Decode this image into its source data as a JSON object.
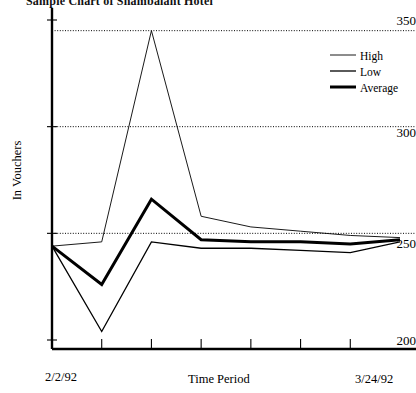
{
  "chart_data": {
    "type": "line",
    "title": "Sample Chart of Shambalaht Hotel",
    "xlabel": "Time Period",
    "ylabel": "In Vouchers",
    "ylim": [
      195,
      356
    ],
    "yticks": [
      200,
      250,
      300,
      350
    ],
    "gridlines": [
      250,
      300,
      345
    ],
    "grid": true,
    "legend_position": "top-right",
    "x_start_label": "2/2/92",
    "x_end_label": "3/24/92",
    "x_tick_count": 6,
    "x": [
      0,
      1,
      2,
      3,
      4,
      5,
      6,
      7
    ],
    "series": [
      {
        "name": "High",
        "color": "#000000",
        "width": 0.9,
        "values": [
          244,
          246,
          345,
          258,
          253,
          251,
          249,
          248
        ]
      },
      {
        "name": "Low",
        "color": "#000000",
        "width": 1.3,
        "values": [
          244,
          204,
          246,
          243,
          243,
          242,
          241,
          246
        ]
      },
      {
        "name": "Average",
        "color": "#000000",
        "width": 3.0,
        "values": [
          244,
          226,
          266,
          247,
          246,
          246,
          245,
          247
        ]
      }
    ]
  },
  "axis": {
    "y_tick_labels": [
      "350",
      "300",
      "250",
      "200"
    ],
    "y_axis_title": "In Vouchers",
    "x_axis_title": "Time Period",
    "x_left_label": "2/2/92",
    "x_right_label": "3/24/92"
  },
  "legend": {
    "items": [
      {
        "label": "High"
      },
      {
        "label": "Low"
      },
      {
        "label": "Average"
      }
    ]
  }
}
